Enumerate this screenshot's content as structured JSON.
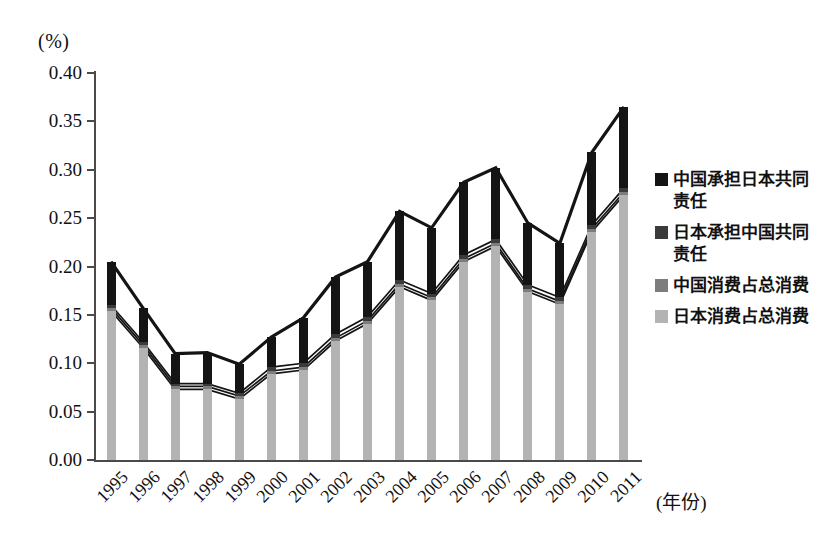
{
  "axis": {
    "unit_label": "(%)",
    "x_title": "(年份)",
    "y_ticks": [
      "0.40",
      "0.35",
      "0.30",
      "0.25",
      "0.20",
      "0.15",
      "0.10",
      "0.05",
      "0.00"
    ],
    "y_min": 0.0,
    "y_max": 0.4,
    "y_step": 0.05
  },
  "legend": {
    "items": [
      {
        "label": "中国承担日本共同责任",
        "color": "#141414"
      },
      {
        "label": "日本承担中国共同责任",
        "color": "#3b3b3b"
      },
      {
        "label": "中国消费占总消费",
        "color": "#7d7d7d"
      },
      {
        "label": "日本消费占总消费",
        "color": "#b3b3b3"
      }
    ]
  },
  "chart_data": {
    "type": "bar",
    "title": "",
    "subtitle": "",
    "xlabel": "(年份)",
    "ylabel": "(%)",
    "ylim": [
      0.0,
      0.4
    ],
    "grid": false,
    "legend_position": "right",
    "stacked_appearance": true,
    "categories": [
      "1995",
      "1996",
      "1997",
      "1998",
      "1999",
      "2000",
      "2001",
      "2002",
      "2003",
      "2004",
      "2005",
      "2006",
      "2007",
      "2008",
      "2009",
      "2010",
      "2011"
    ],
    "series": [
      {
        "name": "中国承担日本共同责任",
        "color": "#141414",
        "values": [
          0.205,
          0.157,
          0.11,
          0.111,
          0.099,
          0.127,
          0.147,
          0.189,
          0.205,
          0.257,
          0.24,
          0.287,
          0.302,
          0.245,
          0.224,
          0.318,
          0.365
        ]
      },
      {
        "name": "日本承担中国共同责任",
        "color": "#3b3b3b",
        "values": [
          0.16,
          0.122,
          0.079,
          0.079,
          0.069,
          0.096,
          0.1,
          0.13,
          0.148,
          0.186,
          0.172,
          0.212,
          0.228,
          0.181,
          0.168,
          0.243,
          0.281
        ]
      },
      {
        "name": "中国消费占总消费",
        "color": "#7d7d7d",
        "values": [
          0.157,
          0.119,
          0.076,
          0.076,
          0.066,
          0.092,
          0.096,
          0.126,
          0.144,
          0.182,
          0.168,
          0.208,
          0.224,
          0.177,
          0.164,
          0.239,
          0.277
        ]
      },
      {
        "name": "日本消费占总消费",
        "color": "#b3b3b3",
        "values": [
          0.154,
          0.116,
          0.073,
          0.073,
          0.063,
          0.089,
          0.093,
          0.123,
          0.141,
          0.179,
          0.165,
          0.205,
          0.221,
          0.174,
          0.161,
          0.236,
          0.274
        ]
      }
    ]
  }
}
